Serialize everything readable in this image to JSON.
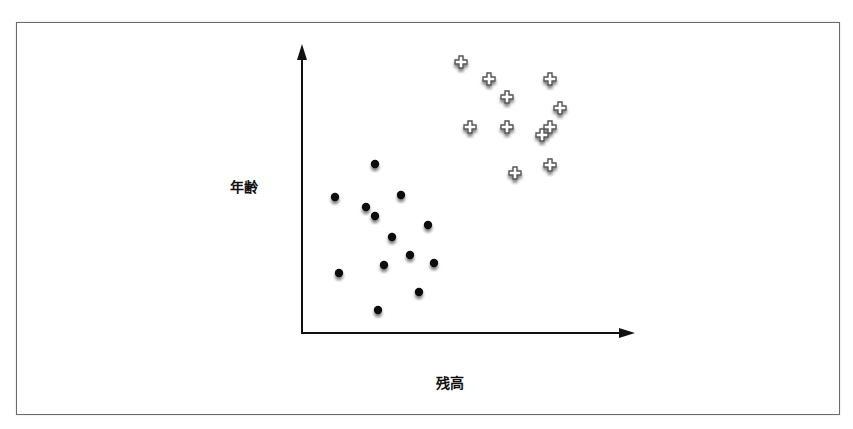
{
  "chart_data": {
    "type": "scatter",
    "title": "",
    "xlabel": "残高",
    "ylabel": "年齢",
    "xlim": [
      0,
      100
    ],
    "ylim": [
      0,
      100
    ],
    "grid": false,
    "ticks": false,
    "legend": null,
    "series": [
      {
        "name": "dot",
        "marker": "filled-circle",
        "color": "#111111",
        "points": [
          [
            21.987951807228917,
            58.68055555555556
          ],
          [
            9.939759036144578,
            47.22222222222222
          ],
          [
            29.819277108433734,
            47.916666666666664
          ],
          [
            19.27710843373494,
            43.75
          ],
          [
            21.987951807228917,
            40.625
          ],
          [
            37.95180722891566,
            37.5
          ],
          [
            27.10843373493976,
            33.33333333333333
          ],
          [
            32.53012048192771,
            27.083333333333332
          ],
          [
            39.75903614457831,
            24.305555555555554
          ],
          [
            24.69879518072289,
            23.61111111111111
          ],
          [
            11.144578313253012,
            20.833333333333332
          ],
          [
            35.24096385542169,
            14.23611111111111
          ],
          [
            22.89156626506024,
            7.986111111111111
          ]
        ]
      },
      {
        "name": "plus",
        "marker": "outlined-plus",
        "color": "#ffffff",
        "stroke": "#555555",
        "points": [
          [
            47.89156626506024,
            94.09722222222223
          ],
          [
            56.32530120481928,
            88.19444444444444
          ],
          [
            74.69879518072288,
            88.19444444444444
          ],
          [
            61.74698795180723,
            81.94444444444444
          ],
          [
            77.71084337349397,
            78.125
          ],
          [
            50.602409638554214,
            71.52777777777779
          ],
          [
            61.74698795180723,
            71.52777777777779
          ],
          [
            74.69879518072288,
            71.52777777777779
          ],
          [
            72.28915662650603,
            68.75
          ],
          [
            74.69879518072288,
            58.33333333333333
          ],
          [
            64.1566265060241,
            55.55555555555556
          ]
        ]
      }
    ]
  },
  "labels": {
    "x": "残高",
    "y": "年齢"
  },
  "layout": {
    "ox": 302,
    "oy": 333,
    "xend": 634,
    "ytop": 45
  }
}
